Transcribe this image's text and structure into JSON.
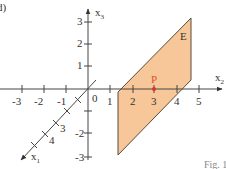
{
  "figure": {
    "panel_label": "d)",
    "caption_fragment": "Fig. 1",
    "plane_label": "E",
    "point_label": "P",
    "colors": {
      "plane_fill": "#f7c79a",
      "plane_edge": "#5a4a3a",
      "axis": "#444444",
      "point": "#d9332a",
      "point_label": "#d9532a"
    },
    "axes": {
      "x2": {
        "label": "x2",
        "label_main": "x",
        "label_sub": "2",
        "ticks": [
          "-3",
          "-2",
          "-1",
          "0",
          "1",
          "2",
          "3",
          "4",
          "5"
        ]
      },
      "x3": {
        "label": "x3",
        "label_main": "x",
        "label_sub": "3",
        "ticks": [
          "3",
          "2",
          "1",
          "-1",
          "-2",
          "-3"
        ]
      },
      "x1": {
        "label": "x1",
        "label_main": "x",
        "label_sub": "1",
        "ticks": [
          "1",
          "2",
          "3",
          "4"
        ]
      }
    },
    "point_P": {
      "x2": 3,
      "x3": 0
    }
  }
}
